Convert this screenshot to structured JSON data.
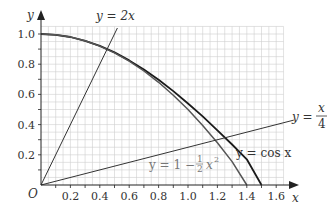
{
  "chart_data": {
    "type": "line",
    "title": "",
    "xlabel": "x",
    "ylabel": "y",
    "origin_label": "O",
    "xlim": [
      0,
      1.7
    ],
    "ylim": [
      0,
      1.05
    ],
    "grid": true,
    "grid_step": 0.05,
    "x_ticks": [
      "0.2",
      "0.4",
      "0.6",
      "0.8",
      "1.0",
      "1.2",
      "1.4",
      "1.6"
    ],
    "y_ticks": [
      "0.2",
      "0.4",
      "0.6",
      "0.8",
      "1.0"
    ],
    "series": [
      {
        "name": "y = cos x",
        "color": "#1a1a1a",
        "width": 1.8,
        "x": [
          0,
          0.1,
          0.2,
          0.3,
          0.4,
          0.5,
          0.6,
          0.7,
          0.8,
          0.9,
          1.0,
          1.1,
          1.2,
          1.3,
          1.4,
          1.5
        ],
        "y": [
          1.0,
          0.995,
          0.98,
          0.955,
          0.921,
          0.878,
          0.825,
          0.765,
          0.697,
          0.622,
          0.54,
          0.454,
          0.362,
          0.268,
          0.17,
          0.0
        ]
      },
      {
        "name": "y = 1 − ½x²",
        "color": "#555555",
        "width": 1.5,
        "x": [
          0,
          0.1,
          0.2,
          0.3,
          0.4,
          0.5,
          0.6,
          0.7,
          0.8,
          0.9,
          1.0,
          1.1,
          1.2,
          1.3,
          1.4
        ],
        "y": [
          1.0,
          0.995,
          0.98,
          0.955,
          0.92,
          0.875,
          0.82,
          0.755,
          0.68,
          0.595,
          0.5,
          0.395,
          0.28,
          0.155,
          0.0
        ]
      },
      {
        "name": "y = 2x",
        "color": "#333333",
        "width": 1,
        "x": [
          0,
          0.52
        ],
        "y": [
          0,
          1.04
        ]
      },
      {
        "name": "y = x/4",
        "color": "#333333",
        "width": 1,
        "x": [
          0,
          1.72
        ],
        "y": [
          0,
          0.43
        ]
      }
    ],
    "annotations": [
      {
        "text": "y = 2x",
        "near": "top of line y=2x"
      },
      {
        "text": "y = x/4",
        "near": "right end of line y=x/4"
      },
      {
        "text": "y = cos x",
        "near": "lower right of cos curve"
      },
      {
        "text": "y = 1 − ½x²",
        "near": "below intersections, gray"
      }
    ]
  },
  "labels": {
    "y_axis": "y",
    "x_axis": "x",
    "origin": "O",
    "line_2x": "y = 2x",
    "cos": "y = cos x",
    "quarter_y": "y =",
    "quarter_num": "x",
    "quarter_den": "4",
    "parabola_left": "y = 1 −",
    "parabola_num": "1",
    "parabola_den": "2",
    "parabola_right": "x",
    "parabola_exp": "2"
  }
}
